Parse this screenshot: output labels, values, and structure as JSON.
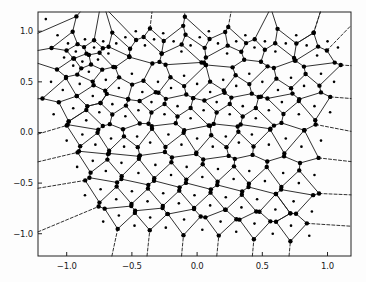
{
  "figure": {
    "type": "voronoi-diagram",
    "background_color": "#fdfdfd",
    "axes_background_color": "#fdfdfd",
    "line_color": "#1a1a1a",
    "point_color": "#000000",
    "vertex_color": "#000000",
    "frame_color": "#222222"
  },
  "axes": {
    "x_label": "",
    "y_label": "",
    "title": "",
    "xlim": [
      -1.22,
      1.18
    ],
    "ylim": [
      -1.22,
      1.19
    ],
    "grid": false,
    "xticks": [
      {
        "value": -1.0,
        "label": "−1.0"
      },
      {
        "value": -0.5,
        "label": "−0.5"
      },
      {
        "value": 0.0,
        "label": "0.0"
      },
      {
        "value": 0.5,
        "label": "0.5"
      },
      {
        "value": 1.0,
        "label": "1.0"
      }
    ],
    "yticks": [
      {
        "value": 1.0,
        "label": "1.0"
      },
      {
        "value": 0.5,
        "label": "0.5"
      },
      {
        "value": 0.0,
        "label": "0.0"
      },
      {
        "value": -0.5,
        "label": "−0.5"
      },
      {
        "value": -1.0,
        "label": "−1.0"
      }
    ],
    "plot_box_px": {
      "left": 38,
      "top": 12,
      "right": 351,
      "bottom": 256
    }
  },
  "chart_data": {
    "type": "scatter",
    "title": "",
    "xlabel": "",
    "ylabel": "",
    "xlim": [
      -1.22,
      1.18
    ],
    "ylim": [
      -1.22,
      1.19
    ],
    "grid": false,
    "legend": null,
    "series": [
      {
        "name": "input points",
        "marker": "small-dot",
        "x": [
          -1.16,
          -1.07,
          -0.99,
          -1.02,
          -0.93,
          -0.86,
          -0.95,
          -0.88,
          -0.79,
          -0.72,
          -0.83,
          -0.76,
          -0.68,
          -0.62,
          -0.55,
          -0.47,
          -0.4,
          -0.33,
          -0.26,
          -0.18,
          -0.12,
          -0.05,
          0.02,
          0.09,
          0.16,
          0.23,
          0.3,
          0.37,
          0.44,
          0.52,
          0.6,
          0.68,
          0.76,
          0.84,
          0.92,
          1.0,
          1.08,
          -1.12,
          -1.03,
          -0.9,
          -0.8,
          -0.7,
          -0.6,
          -0.5,
          -0.42,
          -0.3,
          -0.2,
          -0.1,
          0.0,
          0.1,
          0.2,
          0.3,
          0.4,
          0.5,
          0.62,
          0.72,
          0.82,
          0.95,
          1.05,
          -1.1,
          -0.95,
          -0.85,
          -0.75,
          -0.65,
          -0.55,
          -0.45,
          -0.35,
          -0.25,
          -0.15,
          -0.05,
          0.05,
          0.15,
          0.25,
          0.35,
          0.45,
          0.55,
          0.65,
          0.78,
          0.9,
          1.02,
          -1.0,
          -0.88,
          -0.78,
          -0.66,
          -0.56,
          -0.46,
          -0.36,
          -0.22,
          -0.12,
          0.0,
          0.12,
          0.22,
          0.32,
          0.42,
          0.55,
          0.68,
          0.8,
          0.95,
          -0.92,
          -0.8,
          -0.7,
          -0.58,
          -0.45,
          -0.32,
          -0.2,
          -0.08,
          0.04,
          0.16,
          0.28,
          0.4,
          0.52,
          0.66,
          0.78,
          0.9,
          -0.86,
          -0.74,
          -0.62,
          -0.5,
          -0.38,
          -0.26,
          -0.14,
          -0.02,
          0.1,
          0.22,
          0.34,
          0.46,
          0.6,
          0.74,
          0.88,
          -0.72,
          -0.6,
          -0.48,
          -0.36,
          -0.24,
          -0.1,
          0.04,
          0.18,
          0.3,
          0.44,
          0.58,
          0.72,
          0.86
        ],
        "y": [
          1.12,
          0.96,
          0.88,
          0.74,
          0.8,
          0.92,
          0.66,
          0.7,
          0.84,
          0.9,
          0.6,
          0.72,
          0.78,
          0.88,
          0.94,
          1.0,
          0.86,
          0.92,
          0.98,
          0.9,
          0.8,
          0.86,
          0.94,
          1.0,
          0.88,
          0.78,
          0.9,
          0.96,
          0.84,
          0.9,
          0.8,
          0.88,
          0.96,
          0.86,
          0.76,
          0.9,
          0.84,
          0.5,
          0.42,
          0.48,
          0.36,
          0.52,
          0.44,
          0.58,
          0.4,
          0.5,
          0.44,
          0.56,
          0.48,
          0.4,
          0.52,
          0.46,
          0.58,
          0.5,
          0.42,
          0.54,
          0.46,
          0.58,
          0.5,
          0.18,
          0.24,
          0.12,
          0.2,
          0.28,
          0.16,
          0.22,
          0.3,
          0.18,
          0.26,
          0.14,
          0.22,
          0.3,
          0.18,
          0.26,
          0.14,
          0.22,
          0.3,
          0.18,
          0.26,
          0.2,
          -0.08,
          -0.02,
          -0.12,
          -0.06,
          -0.14,
          -0.04,
          -0.1,
          -0.02,
          -0.12,
          -0.06,
          -0.14,
          -0.04,
          -0.1,
          -0.02,
          -0.12,
          -0.06,
          -0.14,
          -0.08,
          -0.34,
          -0.28,
          -0.38,
          -0.3,
          -0.4,
          -0.32,
          -0.42,
          -0.34,
          -0.44,
          -0.36,
          -0.46,
          -0.38,
          -0.48,
          -0.4,
          -0.5,
          -0.42,
          -0.62,
          -0.56,
          -0.66,
          -0.58,
          -0.68,
          -0.6,
          -0.7,
          -0.62,
          -0.72,
          -0.64,
          -0.74,
          -0.66,
          -0.76,
          -0.68,
          -0.78,
          -0.88,
          -0.82,
          -0.92,
          -0.84,
          -0.94,
          -0.86,
          -0.96,
          -0.88,
          -0.98,
          -0.9,
          -1.0,
          -0.92,
          -1.02
        ]
      }
    ]
  },
  "marker_styles": {
    "seed_point_radius_px": 1.3,
    "voronoi_vertex_radius_px": 2.2,
    "ridge_width_px": 0.9,
    "dash_pattern": "3,2"
  }
}
